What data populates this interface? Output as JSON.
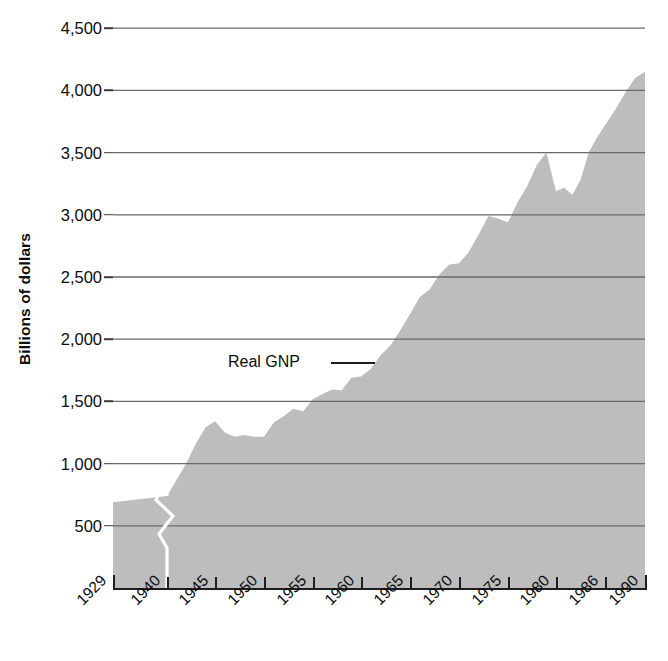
{
  "chart_data": {
    "type": "area",
    "title": "",
    "subtitle": "",
    "xlabel": "",
    "ylabel": "Billions of dollars",
    "series_name": "Real GNP",
    "annotation": "Real GNP",
    "x_tick_labels": [
      "1929",
      "1940",
      "1945",
      "1950",
      "1955",
      "1960",
      "1965",
      "1970",
      "1975",
      "1980",
      "1986",
      "1990"
    ],
    "y_tick_labels": [
      "4,500",
      "4,000",
      "3,500",
      "3,000",
      "2,500",
      "2,000",
      "1,500",
      "1,000",
      "500"
    ],
    "y_tick_values": [
      4500,
      4000,
      3500,
      3000,
      2500,
      2000,
      1500,
      1000,
      500
    ],
    "ylim": [
      0,
      4750
    ],
    "grid": "horizontal",
    "legend": "inline-annotation",
    "axis_break": {
      "present": true,
      "between": [
        "1929",
        "1940"
      ],
      "style": "white-zigzag"
    },
    "colors": {
      "area_fill": "#bdbdbd",
      "gridline": "#6a6a6a",
      "axis": "#1d1d1d",
      "text": "#0d0d0d",
      "break_line": "#ffffff"
    },
    "x": [
      1929,
      1940,
      1941,
      1942,
      1943,
      1944,
      1945,
      1946,
      1947,
      1948,
      1949,
      1950,
      1951,
      1952,
      1953,
      1954,
      1955,
      1956,
      1957,
      1958,
      1959,
      1960,
      1961,
      1962,
      1963,
      1964,
      1965,
      1966,
      1967,
      1968,
      1969,
      1970,
      1971,
      1972,
      1973,
      1974,
      1975,
      1976,
      1977,
      1978,
      1979,
      1980,
      1981,
      1982,
      1983,
      1984,
      1985,
      1986,
      1987,
      1988,
      1989,
      1990
    ],
    "values": [
      690,
      740,
      870,
      1000,
      1160,
      1290,
      1340,
      1250,
      1215,
      1230,
      1215,
      1215,
      1330,
      1380,
      1440,
      1420,
      1520,
      1560,
      1595,
      1590,
      1690,
      1700,
      1760,
      1870,
      1950,
      2070,
      2200,
      2340,
      2400,
      2520,
      2600,
      2610,
      2700,
      2840,
      2990,
      2970,
      2940,
      3100,
      3230,
      3400,
      3500,
      3190,
      3220,
      3160,
      3280,
      3500,
      3620,
      3720,
      3840,
      3980,
      4100,
      4150
    ]
  }
}
